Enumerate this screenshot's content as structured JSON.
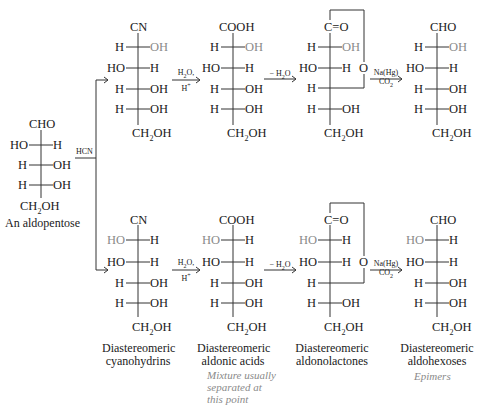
{
  "starting_material": {
    "top": "CHO",
    "rows": [
      {
        "left": "HO",
        "right": "H"
      },
      {
        "left": "H",
        "right": "OH"
      },
      {
        "left": "H",
        "right": "OH"
      }
    ],
    "bottom": "CH2OH",
    "caption": "An aldopentose"
  },
  "reagents": {
    "hcn": "HCN",
    "hydrolysis_line1": "H2O,",
    "hydrolysis_line2": "H+",
    "dehydration": "− H2O",
    "reduction_line1": "Na(Hg)",
    "reduction_line2": "CO2"
  },
  "top_row": {
    "cyanohydrin": {
      "top": "CN",
      "rows": [
        {
          "left": "H",
          "right": "OH",
          "highlight": "right"
        },
        {
          "left": "HO",
          "right": "H"
        },
        {
          "left": "H",
          "right": "OH"
        },
        {
          "left": "H",
          "right": "OH"
        }
      ],
      "bottom": "CH2OH"
    },
    "aldonic_acid": {
      "top": "COOH",
      "rows": [
        {
          "left": "H",
          "right": "OH",
          "highlight": "right"
        },
        {
          "left": "HO",
          "right": "H"
        },
        {
          "left": "H",
          "right": "OH"
        },
        {
          "left": "H",
          "right": "OH"
        }
      ],
      "bottom": "CH2OH"
    },
    "aldonolactone": {
      "top": "C=O",
      "rows": [
        {
          "left": "H",
          "right": "OH",
          "highlight": "right"
        },
        {
          "left": "HO",
          "right": "H"
        },
        {
          "left": "H",
          "right": ""
        },
        {
          "left": "H",
          "right": "OH"
        }
      ],
      "ring_oxygen": "O",
      "bottom": "CH2OH"
    },
    "aldohexose": {
      "top": "CHO",
      "rows": [
        {
          "left": "H",
          "right": "OH",
          "highlight": "right"
        },
        {
          "left": "HO",
          "right": "H"
        },
        {
          "left": "H",
          "right": "OH"
        },
        {
          "left": "H",
          "right": "OH"
        }
      ],
      "bottom": "CH2OH"
    }
  },
  "bottom_row": {
    "cyanohydrin": {
      "top": "CN",
      "rows": [
        {
          "left": "HO",
          "right": "H",
          "highlight": "left"
        },
        {
          "left": "HO",
          "right": "H"
        },
        {
          "left": "H",
          "right": "OH"
        },
        {
          "left": "H",
          "right": "OH"
        }
      ],
      "bottom": "CH2OH",
      "caption_line1": "Diastereomeric",
      "caption_line2": "cyanohydrins"
    },
    "aldonic_acid": {
      "top": "COOH",
      "rows": [
        {
          "left": "HO",
          "right": "H",
          "highlight": "left"
        },
        {
          "left": "HO",
          "right": "H"
        },
        {
          "left": "H",
          "right": "OH"
        },
        {
          "left": "H",
          "right": "OH"
        }
      ],
      "bottom": "CH2OH",
      "caption_line1": "Diastereomeric",
      "caption_line2": "aldonic acids",
      "note_line1": "Mixture usually",
      "note_line2": "separated at",
      "note_line3": "this point"
    },
    "aldonolactone": {
      "top": "C=O",
      "rows": [
        {
          "left": "HO",
          "right": "H",
          "highlight": "left"
        },
        {
          "left": "HO",
          "right": "H"
        },
        {
          "left": "H",
          "right": ""
        },
        {
          "left": "H",
          "right": "OH"
        }
      ],
      "ring_oxygen": "O",
      "bottom": "CH2OH",
      "caption_line1": "Diastereomeric",
      "caption_line2": "aldonolactones"
    },
    "aldohexose": {
      "top": "CHO",
      "rows": [
        {
          "left": "HO",
          "right": "H",
          "highlight": "left"
        },
        {
          "left": "HO",
          "right": "H"
        },
        {
          "left": "H",
          "right": "OH"
        },
        {
          "left": "H",
          "right": "OH"
        }
      ],
      "bottom": "CH2OH",
      "caption_line1": "Diastereomeric",
      "caption_line2": "aldohexoses",
      "note_line1": "Epimers"
    }
  },
  "colors": {
    "ink": "#1a1a1a",
    "highlight_gray": "#8a8a8a"
  }
}
